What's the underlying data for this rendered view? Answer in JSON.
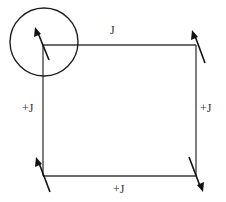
{
  "diagram": {
    "title": "",
    "colors": {
      "background": "#ffffff",
      "edge": "#3a3a3a",
      "spin": "#111111",
      "label": "#333333"
    },
    "edges": [
      {
        "id": "top",
        "label": "J"
      },
      {
        "id": "left",
        "label": "+J"
      },
      {
        "id": "right",
        "label": "+J"
      },
      {
        "id": "bottom",
        "label": "+J"
      }
    ],
    "spins": [
      {
        "id": "top-left",
        "direction": "up",
        "highlighted": true
      },
      {
        "id": "top-right",
        "direction": "up",
        "highlighted": false
      },
      {
        "id": "bottom-left",
        "direction": "up",
        "highlighted": false
      },
      {
        "id": "bottom-right",
        "direction": "down",
        "highlighted": false
      }
    ],
    "highlight": {
      "shape": "circle",
      "target": "top-left"
    }
  }
}
